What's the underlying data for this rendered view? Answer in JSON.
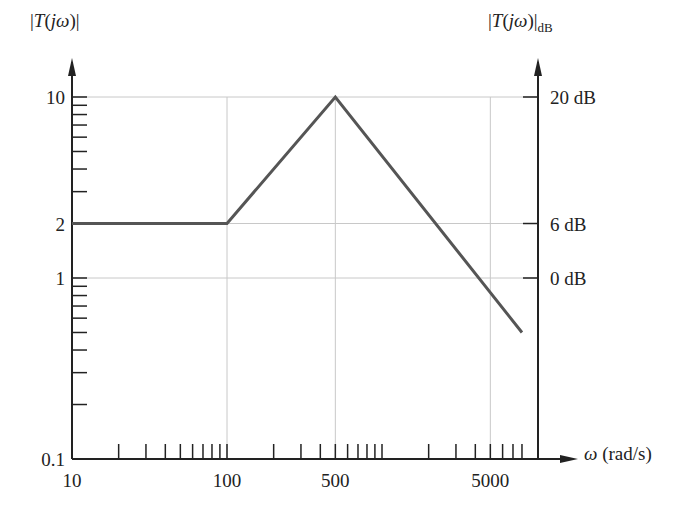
{
  "chart_data": {
    "type": "line",
    "title": "",
    "xlabel": "ω (rad/s)",
    "ylabel_left": "|T(jω)|",
    "ylabel_right": "|T(jω)|dB",
    "x_scale": "log",
    "y_scale": "log",
    "xlim": [
      10,
      8000
    ],
    "ylim": [
      0.1,
      10
    ],
    "x_tick_labels": [
      "10",
      "100",
      "500",
      "5000"
    ],
    "x_tick_values": [
      10,
      100,
      500,
      5000
    ],
    "y_tick_labels_left": [
      "10",
      "2",
      "1",
      "0.1"
    ],
    "y_tick_values_left": [
      10,
      2,
      1,
      0.1
    ],
    "y_tick_labels_right": [
      "20 dB",
      "6 dB",
      "0 dB"
    ],
    "y_tick_values_right": [
      10,
      2,
      1
    ],
    "grid": true,
    "gridlines_x": [
      100,
      500,
      5000
    ],
    "gridlines_y": [
      10,
      2,
      1
    ],
    "series": [
      {
        "name": "|T(jω)| asymptotic",
        "x": [
          10,
          100,
          500,
          8000
        ],
        "y": [
          2,
          2,
          10,
          0.5
        ]
      }
    ]
  },
  "labels": {
    "y_left_main": "|T(jω)|",
    "y_right_main": "|T(jω)|",
    "y_right_sub": "dB",
    "x_axis": "ω (rad/s)",
    "x_ticks": [
      "10",
      "100",
      "500",
      "5000"
    ],
    "y_left_ticks": [
      "10",
      "2",
      "1",
      "0.1"
    ],
    "y_right_ticks": [
      "20 dB",
      "6 dB",
      "0 dB"
    ]
  },
  "colors": {
    "axis": "#222222",
    "grid": "#c8c8c8",
    "curve": "#555555"
  }
}
